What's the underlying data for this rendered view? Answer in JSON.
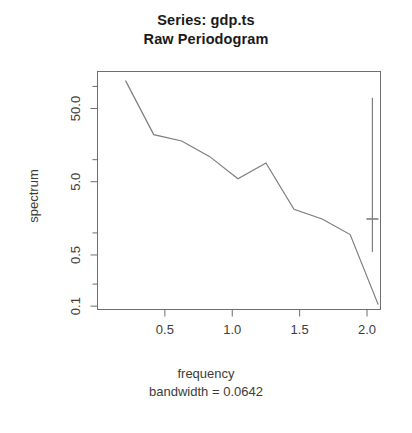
{
  "title": {
    "line1": "Series: gdp.ts",
    "line2": "Raw Periodogram"
  },
  "axes": {
    "ylabel": "spectrum",
    "xlabel": "frequency",
    "subtitle": "bandwidth = 0.0642",
    "y_ticks": [
      "50.0",
      "5.0",
      "0.5",
      "0.1"
    ],
    "x_ticks": [
      "0.5",
      "1.0",
      "1.5",
      "2.0"
    ]
  },
  "colors": {
    "line": "#7d7d7d",
    "frame": "#6e6e6e",
    "text": "#3c3c3c",
    "title": "#1a1a1a",
    "background": "#ffffff"
  },
  "chart_data": {
    "type": "line",
    "xlabel": "frequency",
    "ylabel": "spectrum",
    "subtitle": "bandwidth = 0.0642",
    "yscale": "log",
    "xlim": [
      0.0,
      2.1
    ],
    "ylim": [
      0.09,
      160
    ],
    "grid": false,
    "legend": null,
    "x": [
      0.208,
      0.417,
      0.625,
      0.833,
      1.042,
      1.25,
      1.458,
      1.667,
      1.875,
      2.083
    ],
    "y": [
      120.0,
      22.0,
      18.0,
      11.0,
      5.5,
      9.0,
      2.1,
      1.55,
      0.95,
      0.105
    ],
    "x_tick_values": [
      0.5,
      1.0,
      1.5,
      2.0
    ],
    "y_tick_values": [
      50.0,
      5.0,
      0.5,
      0.1
    ],
    "y_minor_tick_values": [
      100.0,
      10.0,
      1.0,
      0.2
    ],
    "confidence_bar": {
      "x": 2.04,
      "center": 1.55,
      "lower": 0.55,
      "upper": 70.0
    }
  }
}
